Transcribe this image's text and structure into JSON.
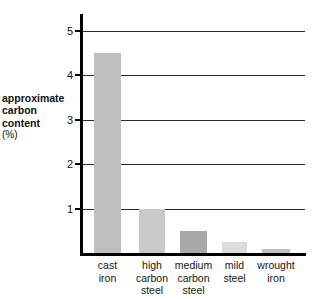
{
  "chart_data": {
    "type": "bar",
    "title": "",
    "xlabel": "",
    "ylabel": "approximate carbon content (%)",
    "ylabel_lines": [
      "approximate",
      "carbon",
      "content",
      "(%)"
    ],
    "unit_line": "(%)",
    "categories": [
      "cast iron",
      "high carbon steel",
      "medium carbon steel",
      "mild steel",
      "wrought iron"
    ],
    "category_lines": [
      [
        "cast",
        "iron"
      ],
      [
        "high",
        "carbon",
        "steel"
      ],
      [
        "medium",
        "carbon",
        "steel"
      ],
      [
        "mild",
        "steel"
      ],
      [
        "wrought",
        "iron"
      ]
    ],
    "values": [
      4.5,
      1.0,
      0.5,
      0.25,
      0.1
    ],
    "ylim": [
      0,
      5.4
    ],
    "yticks": [
      1,
      2,
      3,
      4,
      5
    ],
    "ytick_labels": [
      "1",
      "2",
      "3",
      "4",
      "5"
    ],
    "grid": true,
    "legend": "none",
    "bar_colors": [
      "#bfbfbf",
      "#c9c9c9",
      "#a8a8a8",
      "#dcdcdc",
      "#c0c0c0"
    ],
    "axis_color": "#000000",
    "grid_color": "#2b2b2b",
    "background_color": "#ffffff"
  }
}
